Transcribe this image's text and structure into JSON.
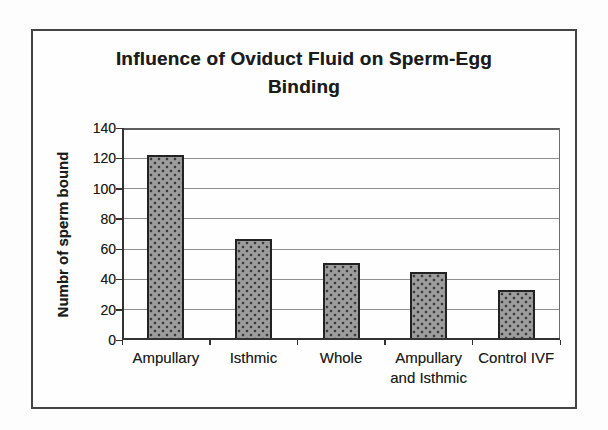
{
  "figure": {
    "background": "#fdfdfd",
    "frame_border_color": "#444444"
  },
  "chart_data": {
    "type": "bar",
    "title": "Influence of Oviduct Fluid on Sperm-Egg Binding",
    "title_lines": [
      "Influence of Oviduct Fluid on Sperm-Egg",
      "Binding"
    ],
    "ylabel": "Numbr of sperm bound",
    "xlabel": "",
    "categories": [
      "Ampullary",
      "Isthmic",
      "Whole",
      "Ampullary and Isthmic",
      "Control IVF"
    ],
    "category_label_lines": [
      [
        "Ampullary"
      ],
      [
        "Isthmic"
      ],
      [
        "Whole"
      ],
      [
        "Ampullary",
        "and Isthmic"
      ],
      [
        "Control IVF"
      ]
    ],
    "values": [
      122,
      67,
      51,
      45,
      33
    ],
    "ylim": [
      0,
      140
    ],
    "yticks": [
      0,
      20,
      40,
      60,
      80,
      100,
      120,
      140
    ],
    "grid": true,
    "legend": false,
    "colors": {
      "bar_fill": "#9d9d9d",
      "bar_dot": "#3c3c3c",
      "bar_border": "#222222",
      "gridline": "#8f8f8f",
      "axis": "#333333",
      "text": "#1c1c1c"
    }
  }
}
